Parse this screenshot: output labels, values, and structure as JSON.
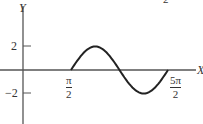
{
  "chart_data": {
    "type": "line",
    "title": "",
    "xlabel": "X",
    "ylabel": "Y",
    "function": "y = 2 sin(x - π/2) on [π/2, 5π/2]",
    "x_ticks": [
      {
        "num": "π",
        "den": "2",
        "value": 1.5708
      },
      {
        "num": "5π",
        "den": "2",
        "value": 7.854
      }
    ],
    "y_ticks": [
      {
        "label": "2",
        "value": 2
      },
      {
        "label": "−2",
        "value": -2
      }
    ],
    "series": [
      {
        "name": "curve",
        "x": [
          1.5708,
          2.3562,
          3.1416,
          3.927,
          4.7124,
          5.4978,
          6.2832,
          7.0686,
          7.854
        ],
        "y": [
          0,
          1.414,
          2,
          1.414,
          0,
          -1.414,
          -2,
          -1.414,
          0
        ]
      }
    ],
    "xlim": [
      -1.5,
      9.8
    ],
    "ylim": [
      -3.5,
      4
    ],
    "grid": false,
    "legend": "none",
    "stroke_color": "#222222",
    "axis_color": "#555555",
    "cropped_fragment": "2"
  }
}
